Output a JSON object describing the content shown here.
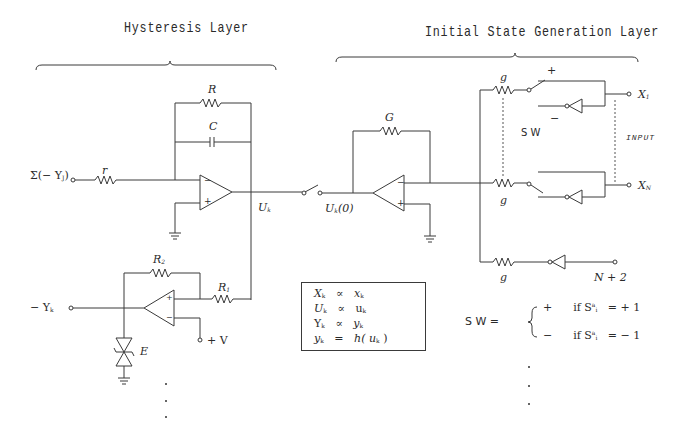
{
  "diagram": {
    "sections": {
      "hysteresis_layer": {
        "title": "Hysteresis Layer"
      },
      "initial_state_layer": {
        "title": "Initial State Generation Layer"
      }
    },
    "hysteresis": {
      "input_label": "Σ(− Y",
      "input_sub": "J",
      "input_close": ")",
      "r_label": "r",
      "R_label": "R",
      "C_label": "C",
      "U_label": "U",
      "U_sub": "k",
      "opamp_minus": "−",
      "opamp_plus": "+",
      "negY_label": "− Y",
      "negY_sub": "k",
      "R2_label": "R",
      "R2_sub": "2",
      "R1_label": "R",
      "R1_sub": "1",
      "E_label": "E",
      "V_label": "+ V"
    },
    "switch": {
      "U0_label": "U",
      "U0_sub": "k",
      "U0_suffix": "(0)"
    },
    "initial_state": {
      "G_label": "G",
      "g_labels": [
        "g",
        "g",
        "g"
      ],
      "plus": "+",
      "minus": "−",
      "sw_label": "S W",
      "input_label": "INPUT",
      "X1_label": "X",
      "X1_sub": "1",
      "XN_label": "X",
      "XN_sub": "N",
      "N2_label": "N + 2"
    },
    "equations": [
      {
        "lhs": "X",
        "lhs_sub": "k",
        "op": "∝",
        "rhs": "x",
        "rhs_sub": "k",
        "rhs_suffix": ""
      },
      {
        "lhs": "U",
        "lhs_sub": "k",
        "op": "∝",
        "rhs": "u",
        "rhs_sub": "k",
        "rhs_suffix": ""
      },
      {
        "lhs": "Y",
        "lhs_sub": "k",
        "op": "∝",
        "rhs": "y",
        "rhs_sub": "k",
        "rhs_suffix": ""
      },
      {
        "lhs": "y",
        "lhs_sub": "k",
        "op": "=",
        "rhs": "h( u",
        "rhs_sub": "k",
        "rhs_suffix": " )"
      }
    ],
    "sw_definition": {
      "lhs": "S W  =",
      "cases": [
        {
          "sign": "+",
          "cond": "if  S",
          "sup": "a",
          "sub": "i",
          "rhs": "=  + 1"
        },
        {
          "sign": "−",
          "cond": "if  S",
          "sup": "a",
          "sub": "i",
          "rhs": "=  − 1"
        }
      ]
    },
    "ellipsis": "⋮"
  }
}
